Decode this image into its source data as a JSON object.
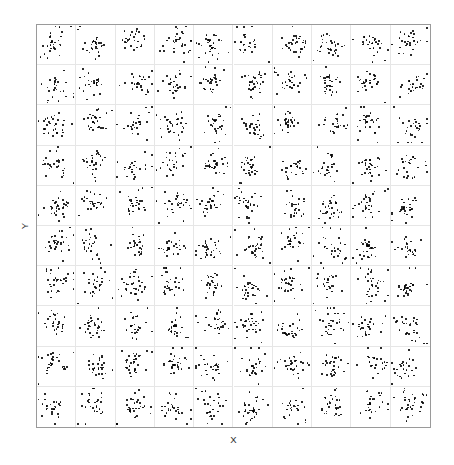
{
  "figure": {
    "background_color": "#ffffff",
    "border_color": "#9a9a9a",
    "gridline_color": "#e6e6e6",
    "point_color": "#000000"
  },
  "axes": {
    "ylabel": "Y",
    "xlabel": "X"
  },
  "chart_data": {
    "type": "scatter",
    "title": "",
    "subtitle": "",
    "xlabel": "X",
    "ylabel": "Y",
    "grid": true,
    "legend": null,
    "facet": {
      "rows": 10,
      "cols": 10,
      "panels": 100,
      "points_per_panel": 28,
      "shared_axes": true,
      "tick_labels": false,
      "tick_marks": false
    },
    "xlim": [
      0,
      1
    ],
    "ylim": [
      0,
      1
    ],
    "panel_seeds": [
      101,
      102,
      103,
      104,
      105,
      106,
      107,
      108,
      109,
      110,
      201,
      202,
      203,
      204,
      205,
      206,
      207,
      208,
      209,
      210,
      301,
      302,
      303,
      304,
      305,
      306,
      307,
      308,
      309,
      310,
      401,
      402,
      403,
      404,
      405,
      406,
      407,
      408,
      409,
      410,
      501,
      502,
      503,
      504,
      505,
      506,
      507,
      508,
      509,
      510,
      601,
      602,
      603,
      604,
      605,
      606,
      607,
      608,
      609,
      610,
      701,
      702,
      703,
      704,
      705,
      706,
      707,
      708,
      709,
      710,
      801,
      802,
      803,
      804,
      805,
      806,
      807,
      808,
      809,
      810,
      901,
      902,
      903,
      904,
      905,
      906,
      907,
      908,
      909,
      910,
      1001,
      1002,
      1003,
      1004,
      1005,
      1006,
      1007,
      1008,
      1009,
      1010
    ],
    "cloud": {
      "center_x": 0.5,
      "center_y": 0.5,
      "center_jitter": 0.09,
      "spread_x": 0.17,
      "spread_y": 0.17,
      "outlier_fraction": 0.12,
      "outlier_spread_multiplier": 2.4
    }
  }
}
